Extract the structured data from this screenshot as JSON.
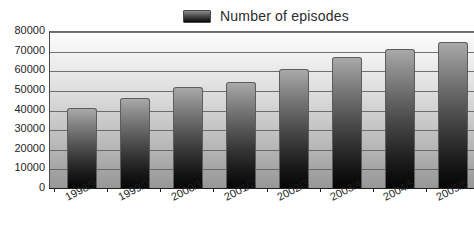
{
  "chart_data": {
    "type": "bar",
    "title": "",
    "xlabel": "",
    "ylabel": "",
    "categories": [
      "1998/9",
      "1999/0",
      "2000/1",
      "2001/2",
      "2002/3",
      "2003/4",
      "2004/5",
      "2005/6"
    ],
    "values": [
      41000,
      46000,
      51500,
      54000,
      60500,
      66500,
      71000,
      74500
    ],
    "series": [
      {
        "name": "Number of episodes",
        "values": [
          41000,
          46000,
          51500,
          54000,
          60500,
          66500,
          71000,
          74500
        ]
      }
    ],
    "ylim": [
      0,
      80000
    ],
    "yticks": [
      0,
      10000,
      20000,
      30000,
      40000,
      50000,
      60000,
      70000,
      80000
    ],
    "ytick_labels": [
      "0",
      "10000",
      "20000",
      "30000",
      "40000",
      "50000",
      "60000",
      "70000",
      "80000"
    ],
    "grid": true,
    "legend_position": "top-center",
    "bar_color_top": "#a9a9a9",
    "bar_color_bottom": "#050505",
    "plot_background_top": "#fdfdfd",
    "plot_background_bottom": "#979797"
  },
  "legend": {
    "label": "Number of episodes",
    "swatch_name": "legend-swatch"
  }
}
